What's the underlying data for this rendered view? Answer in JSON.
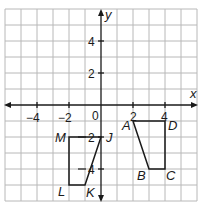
{
  "axes": {
    "x_label": "x",
    "y_label": "y",
    "x_range": [
      -6,
      6
    ],
    "y_range": [
      -6,
      6
    ],
    "x_ticks": [
      {
        "value": -4,
        "label": "−4"
      },
      {
        "value": -2,
        "label": "−2"
      },
      {
        "value": 2,
        "label": "2"
      },
      {
        "value": 4,
        "label": "4"
      }
    ],
    "y_ticks": [
      {
        "value": 4,
        "label": "4"
      },
      {
        "value": 2,
        "label": "2"
      },
      {
        "value": -2,
        "label": "2"
      },
      {
        "value": -4,
        "label": "4"
      }
    ],
    "origin_label": "0"
  },
  "figures": [
    {
      "name": "ABCD",
      "vertices": [
        {
          "label": "A",
          "x": 2,
          "y": -1
        },
        {
          "label": "B",
          "x": 3,
          "y": -4
        },
        {
          "label": "C",
          "x": 4,
          "y": -4
        },
        {
          "label": "D",
          "x": 4,
          "y": -1
        }
      ]
    },
    {
      "name": "JKLM",
      "vertices": [
        {
          "label": "J",
          "x": 0,
          "y": -2
        },
        {
          "label": "K",
          "x": -1,
          "y": -5
        },
        {
          "label": "L",
          "x": -2,
          "y": -5
        },
        {
          "label": "M",
          "x": -2,
          "y": -2
        }
      ]
    }
  ],
  "labels": {
    "A": "A",
    "B": "B",
    "C": "C",
    "D": "D",
    "J": "J",
    "K": "K",
    "L": "L",
    "M": "M",
    "x_m4": "−4",
    "x_m2": "−2",
    "x_2": "2",
    "x_4": "4",
    "y_4": "4",
    "y_2": "2",
    "y_m2": "2",
    "y_m4": "4",
    "origin": "0",
    "x_axis": "x",
    "y_axis": "y"
  },
  "colors": {
    "grid": "#b8b8b8",
    "axis": "#1a1a1a",
    "figure": "#1a1a1a",
    "background": "#ffffff"
  }
}
